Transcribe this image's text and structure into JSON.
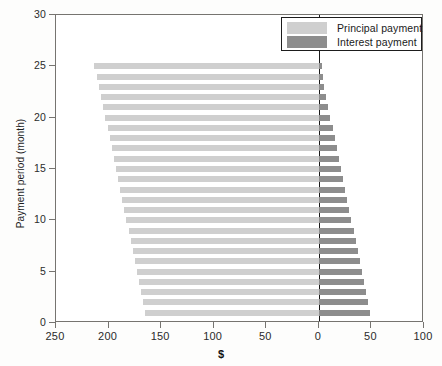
{
  "chart_data": {
    "type": "bar",
    "orientation": "horizontal",
    "title": "",
    "xlabel": "$",
    "ylabel": "Payment period (month)",
    "grid": false,
    "legend_position": "top-right",
    "xaxis": {
      "tick_labels": [
        "250",
        "200",
        "150",
        "100",
        "50",
        "0",
        "50",
        "100"
      ],
      "tick_values": [
        -250,
        -200,
        -150,
        -100,
        -50,
        0,
        50,
        100
      ],
      "xlim": [
        -250,
        100
      ],
      "note": "left side mirrored: principal plotted to the left of zero, interest to the right"
    },
    "yaxis": {
      "tick_labels": [
        "0",
        "5",
        "10",
        "15",
        "20",
        "25",
        "30"
      ],
      "tick_values": [
        0,
        5,
        10,
        15,
        20,
        25,
        30
      ],
      "ylim": [
        0,
        30
      ]
    },
    "series": [
      {
        "name": "Principal payment",
        "color": "#cfcfcf",
        "side": "left",
        "values": [
          165,
          167,
          169,
          171,
          173,
          175,
          177,
          179,
          181,
          183,
          185,
          187,
          189,
          191,
          193,
          195,
          197,
          199,
          201,
          203,
          205,
          207,
          209,
          211,
          214
        ]
      },
      {
        "name": "Interest payment",
        "color": "#8d8d8d",
        "side": "right",
        "values": [
          49,
          47,
          45,
          43,
          41,
          39,
          37,
          35,
          33,
          31,
          29,
          27,
          25,
          23,
          21,
          19,
          17,
          15,
          13,
          11,
          9,
          7,
          5,
          4,
          3
        ]
      }
    ],
    "categories": [
      1,
      2,
      3,
      4,
      5,
      6,
      7,
      8,
      9,
      10,
      11,
      12,
      13,
      14,
      15,
      16,
      17,
      18,
      19,
      20,
      21,
      22,
      23,
      24,
      25
    ]
  },
  "legend": {
    "items": [
      {
        "label": "Principal payment",
        "color": "#cfcfcf"
      },
      {
        "label": "Interest payment",
        "color": "#8d8d8d"
      }
    ]
  }
}
